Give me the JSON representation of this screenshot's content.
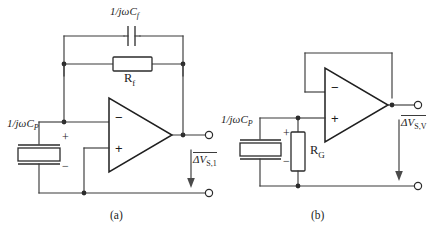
{
  "figure": {
    "width": 440,
    "height": 231,
    "background": "#ffffff",
    "line_color": "#2b2b2b"
  },
  "circuit_a": {
    "caption": "(a)",
    "feedback_capacitor": {
      "label_numerator": "1/jωC",
      "label_subscript": "f",
      "full_label": "1/jωC_f",
      "type": "capacitor"
    },
    "feedback_resistor": {
      "label_main": "R",
      "label_subscript": "f",
      "full_label": "R_f",
      "type": "resistor"
    },
    "source_capacitor": {
      "label_numerator": "1/jωC",
      "label_subscript": "P",
      "full_label": "1/jωC_P",
      "type": "capacitor",
      "polarity_top": "+",
      "polarity_bottom": "−"
    },
    "opamp": {
      "inverting_input": "−",
      "noninverting_input": "+",
      "type": "operational-amplifier"
    },
    "output": {
      "label_delta": "ΔV",
      "label_subscript": "S,1",
      "full_label": "ΔV_S,1",
      "arrow_direction": "down"
    }
  },
  "circuit_b": {
    "caption": "(b)",
    "source_capacitor": {
      "label_numerator": "1/jωC",
      "label_subscript": "P",
      "full_label": "1/jωC_P",
      "type": "capacitor",
      "polarity_top": "+",
      "polarity_bottom": "−"
    },
    "gain_resistor": {
      "label_main": "R",
      "label_subscript": "G",
      "full_label": "R_G",
      "type": "resistor"
    },
    "opamp": {
      "inverting_input": "−",
      "noninverting_input": "+",
      "type": "operational-amplifier"
    },
    "output": {
      "label_delta": "ΔV",
      "label_subscript": "S,V",
      "full_label": "ΔV_S,V",
      "arrow_direction": "down"
    }
  }
}
